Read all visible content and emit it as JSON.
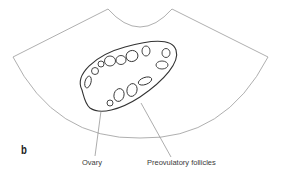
{
  "panel_letter": "b",
  "labels": {
    "ovary": "Ovary",
    "follicles": "Preovulatory follicles"
  },
  "colors": {
    "sector_outline": "#9a9a9a",
    "ovary_outline": "#333333",
    "follicle_outline": "#333333",
    "leader_line": "#8a8a8a",
    "text": "#3a3a3a"
  },
  "diagram": {
    "follicle_count": 13
  }
}
